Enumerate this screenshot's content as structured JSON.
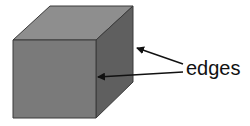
{
  "diagram": {
    "label": "edges",
    "colors": {
      "front_face": "#7a7a7a",
      "top_face": "#8e8e8e",
      "right_face": "#5f5f5f",
      "outline": "#3a3a3a",
      "arrow": "#111111"
    },
    "arrows": [
      {
        "from": [
          183,
          64
        ],
        "to": [
          136,
          48
        ]
      },
      {
        "from": [
          183,
          72
        ],
        "to": [
          98,
          77
        ]
      }
    ]
  }
}
